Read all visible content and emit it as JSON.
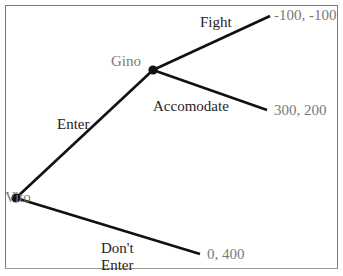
{
  "diagram": {
    "type": "extensive-form game tree",
    "players": {
      "root": "Vito",
      "second": "Gino"
    },
    "actions": {
      "enter": "Enter",
      "dont_enter_line1": "Don't",
      "dont_enter_line2": "Enter",
      "fight": "Fight",
      "accommodate": "Accomodate"
    },
    "payoffs": {
      "fight": "-100, -100",
      "accommodate": "300, 200",
      "dont_enter": "0, 400"
    },
    "colors": {
      "line": "#111111",
      "node": "#111111",
      "player_label": "#7a7a7a",
      "payoff_label": "#7a7a7a",
      "action_label": "#1e1e1e",
      "frame": "#7a7a7a"
    }
  }
}
